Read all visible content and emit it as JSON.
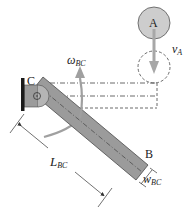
{
  "diagram": {
    "type": "mechanism",
    "labels": {
      "point_a": "A",
      "point_b": "B",
      "point_c": "C",
      "velocity_a_main": "v",
      "velocity_a_sub": "A",
      "omega_main": "ω",
      "omega_sub": "BC",
      "length_main": "L",
      "length_sub": "BC",
      "width_main": "w",
      "width_sub": "BC"
    },
    "colors": {
      "bar_fill": "#9b9b9b",
      "bar_stroke": "#4a4a4a",
      "circle_a_fill": "#cdcdcd",
      "arrow_fill": "#a7a7a7",
      "wall": "#1a1a1a",
      "line": "#333333"
    },
    "elements": [
      {
        "id": "wall",
        "desc": "fixed wall support on left"
      },
      {
        "id": "pin-c",
        "desc": "pin joint C attaching bar BC to wall"
      },
      {
        "id": "bar-bc",
        "desc": "rectangular bar BC rotated downward from C to B"
      },
      {
        "id": "circle-a",
        "desc": "solid circle A above, moving down"
      },
      {
        "id": "circle-a-dashed",
        "desc": "dashed circle showing A's later position"
      },
      {
        "id": "velocity-arrow",
        "desc": "downward arrow v_A"
      },
      {
        "id": "omega-arrow",
        "desc": "curved counterclockwise arrow omega_BC"
      },
      {
        "id": "dimension-length",
        "desc": "L_BC dimension along bar"
      },
      {
        "id": "dimension-width",
        "desc": "w_BC dimension across bar end"
      },
      {
        "id": "dashed-outline",
        "desc": "dash-dot outline of bar in horizontal position"
      }
    ]
  }
}
